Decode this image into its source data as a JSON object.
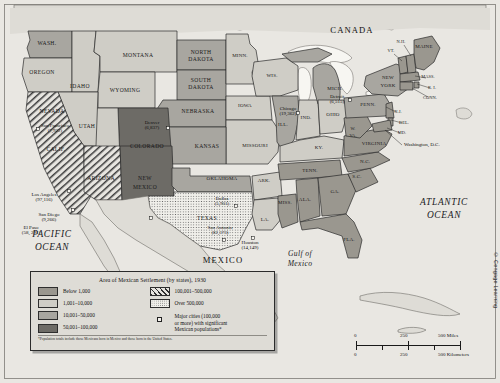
{
  "map": {
    "countries": [
      {
        "name": "CANADA",
        "x": 352,
        "y": 33
      },
      {
        "name": "MEXICO",
        "x": 223,
        "y": 263
      }
    ],
    "oceans": [
      {
        "name": "PACIFIC",
        "x": 52,
        "y": 237
      },
      {
        "name": "OCEAN",
        "x": 52,
        "y": 250
      },
      {
        "name": "ATLANTIC",
        "x": 444,
        "y": 205
      },
      {
        "name": "OCEAN",
        "x": 444,
        "y": 218
      },
      {
        "name": "Gulf of",
        "x": 300,
        "y": 256
      },
      {
        "name": "Mexico",
        "x": 300,
        "y": 266
      }
    ],
    "states": [
      {
        "abbr": "WASH.",
        "x": 47,
        "y": 45,
        "cls": "",
        "category": "10,001-50,000"
      },
      {
        "abbr": "OREGON",
        "x": 42,
        "y": 74,
        "cls": "",
        "category": "1,001-10,000"
      },
      {
        "abbr": "IDAHO",
        "x": 80,
        "y": 88,
        "cls": "",
        "category": "1,001-10,000"
      },
      {
        "abbr": "MONTANA",
        "x": 138,
        "y": 57,
        "cls": "",
        "category": "1,001-10,000"
      },
      {
        "abbr": "NORTH",
        "x": 201,
        "y": 54,
        "cls": "",
        "category": "10,001-50,000"
      },
      {
        "abbr": "DAKOTA",
        "x": 201,
        "y": 61,
        "cls": "",
        "category": "10,001-50,000"
      },
      {
        "abbr": "SOUTH",
        "x": 201,
        "y": 82,
        "cls": "",
        "category": "10,001-50,000"
      },
      {
        "abbr": "DAKOTA",
        "x": 201,
        "y": 89,
        "cls": "",
        "category": "10,001-50,000"
      },
      {
        "abbr": "WYOMING",
        "x": 125,
        "y": 92,
        "cls": "",
        "category": "1,001-10,000"
      },
      {
        "abbr": "NEVADA",
        "x": 52,
        "y": 113,
        "cls": "",
        "category": "1,001-10,000"
      },
      {
        "abbr": "UTAH",
        "x": 87,
        "y": 128,
        "cls": "",
        "category": "1,001-10,000"
      },
      {
        "abbr": "COLORADO",
        "x": 147,
        "y": 148,
        "cls": "",
        "category": "50,001-100,000"
      },
      {
        "abbr": "NEBRASKA",
        "x": 198,
        "y": 113,
        "cls": "",
        "category": "10,001-50,000"
      },
      {
        "abbr": "KANSAS",
        "x": 207,
        "y": 148,
        "cls": "",
        "category": "10,001-50,000"
      },
      {
        "abbr": "MINN.",
        "x": 240,
        "y": 57,
        "cls": "sm",
        "category": "1,001-10,000"
      },
      {
        "abbr": "IOWA",
        "x": 245,
        "y": 107,
        "cls": "sm",
        "category": "1,001-10,000"
      },
      {
        "abbr": "WIS.",
        "x": 272,
        "y": 77,
        "cls": "sm",
        "category": "1,001-10,000"
      },
      {
        "abbr": "MISSOURI",
        "x": 255,
        "y": 147,
        "cls": "sm",
        "category": "1,001-10,000"
      },
      {
        "abbr": "ILL.",
        "x": 283,
        "y": 126,
        "cls": "sm",
        "category": "10,001-50,000"
      },
      {
        "abbr": "IND.",
        "x": 306,
        "y": 119,
        "cls": "sm",
        "category": "1,001-10,000"
      },
      {
        "abbr": "MICH.",
        "x": 335,
        "y": 90,
        "cls": "sm",
        "category": "10,001-50,000"
      },
      {
        "abbr": "OHIO",
        "x": 333,
        "y": 116,
        "cls": "sm",
        "category": "1,001-10,000"
      },
      {
        "abbr": "KY.",
        "x": 319,
        "y": 149,
        "cls": "sm",
        "category": "1,001-10,000"
      },
      {
        "abbr": "CALIF.",
        "x": 56,
        "y": 151,
        "cls": "",
        "category": "100,001-500,000"
      },
      {
        "abbr": "ARIZONA",
        "x": 101,
        "y": 180,
        "cls": "",
        "category": "100,001-500,000"
      },
      {
        "abbr": "NEW",
        "x": 145,
        "y": 180,
        "cls": "",
        "category": "50,001-100,000"
      },
      {
        "abbr": "MEXICO",
        "x": 145,
        "y": 189,
        "cls": "",
        "category": "50,001-100,000"
      },
      {
        "abbr": "OKLAHOMA",
        "x": 222,
        "y": 180,
        "cls": "sm",
        "category": "10,001-50,000"
      },
      {
        "abbr": "TEXAS",
        "x": 207,
        "y": 220,
        "cls": "",
        "category": "Over 500,000"
      },
      {
        "abbr": "ARK.",
        "x": 264,
        "y": 182,
        "cls": "sm",
        "category": "1,001-10,000"
      },
      {
        "abbr": "LA.",
        "x": 265,
        "y": 221,
        "cls": "sm",
        "category": "1,001-10,000"
      },
      {
        "abbr": "MISS.",
        "x": 285,
        "y": 204,
        "cls": "sm",
        "category": "Below 1,000"
      },
      {
        "abbr": "TENN.",
        "x": 310,
        "y": 172,
        "cls": "sm",
        "category": "Below 1,000"
      },
      {
        "abbr": "ALA.",
        "x": 305,
        "y": 201,
        "cls": "sm",
        "category": "Below 1,000"
      },
      {
        "abbr": "GA.",
        "x": 335,
        "y": 193,
        "cls": "sm",
        "category": "Below 1,000"
      },
      {
        "abbr": "FLA.",
        "x": 349,
        "y": 241,
        "cls": "sm",
        "category": "Below 1,000"
      },
      {
        "abbr": "S.C.",
        "x": 357,
        "y": 178,
        "cls": "sm",
        "category": "Below 1,000"
      },
      {
        "abbr": "N.C.",
        "x": 365,
        "y": 163,
        "cls": "sm",
        "category": "Below 1,000"
      },
      {
        "abbr": "VIRGINIA",
        "x": 374,
        "y": 145,
        "cls": "sm",
        "category": "Below 1,000"
      },
      {
        "abbr": "W.",
        "x": 353,
        "y": 130,
        "cls": "xs",
        "category": "Below 1,000"
      },
      {
        "abbr": "VA.",
        "x": 353,
        "y": 137,
        "cls": "xs",
        "category": "Below 1,000"
      },
      {
        "abbr": "PENN.",
        "x": 368,
        "y": 106,
        "cls": "sm",
        "category": "10,001-50,000"
      },
      {
        "abbr": "NEW",
        "x": 388,
        "y": 79,
        "cls": "sm",
        "category": "10,001-50,000"
      },
      {
        "abbr": "YORK",
        "x": 388,
        "y": 87,
        "cls": "sm",
        "category": "10,001-50,000"
      },
      {
        "abbr": "MAINE",
        "x": 424,
        "y": 48,
        "cls": "sm",
        "category": "Below 1,000"
      }
    ],
    "callout_states": [
      {
        "abbr": "N.H.",
        "x": 401,
        "y": 43,
        "lx1": 404,
        "ly1": 45,
        "lx2": 411,
        "ly2": 56,
        "category": "Below 1,000"
      },
      {
        "abbr": "VT.",
        "x": 391,
        "y": 52,
        "lx1": 394,
        "ly1": 54,
        "lx2": 402,
        "ly2": 61,
        "category": "Below 1,000"
      },
      {
        "abbr": "MASS.",
        "x": 428,
        "y": 78,
        "lx1": 426,
        "ly1": 78,
        "lx2": 415,
        "ly2": 76,
        "category": "Below 1,000"
      },
      {
        "abbr": "R. I.",
        "x": 432,
        "y": 89,
        "lx1": 430,
        "ly1": 88,
        "lx2": 417,
        "ly2": 84,
        "category": "Below 1,000"
      },
      {
        "abbr": "CONN.",
        "x": 430,
        "y": 99,
        "lx1": 428,
        "ly1": 97,
        "lx2": 412,
        "ly2": 88,
        "category": "Below 1,000"
      },
      {
        "abbr": "N.J.",
        "x": 398,
        "y": 113,
        "lx1": 396,
        "ly1": 112,
        "lx2": 386,
        "ly2": 107,
        "category": "Below 1,000"
      },
      {
        "abbr": "DEL.",
        "x": 404,
        "y": 124,
        "lx1": 402,
        "ly1": 123,
        "lx2": 391,
        "ly2": 120,
        "category": "Below 1,000"
      },
      {
        "abbr": "MD.",
        "x": 402,
        "y": 134,
        "lx1": 400,
        "ly1": 133,
        "lx2": 387,
        "ly2": 128,
        "category": "Below 1,000"
      },
      {
        "abbr": "Washington, D.C.",
        "x": 404,
        "y": 146,
        "lx1": 402,
        "ly1": 145,
        "lx2": 385,
        "ly2": 130,
        "category": ""
      }
    ],
    "cities": [
      {
        "name": "San Francisco",
        "pop": "(7,922)",
        "lx": 55,
        "ly": 127,
        "dx": 38,
        "dy": 129
      },
      {
        "name": "Los Angeles",
        "pop": "(97,116)",
        "lx": 44,
        "ly": 196,
        "dx": 69,
        "dy": 191
      },
      {
        "name": "San Diego",
        "pop": "(9,266)",
        "lx": 49,
        "ly": 216,
        "dx": 73,
        "dy": 210
      },
      {
        "name": "Denver",
        "pop": "(6,837)",
        "lx": 152,
        "ly": 124,
        "dx": 168,
        "dy": 128
      },
      {
        "name": "El Paso",
        "pop": "(58, 291)",
        "lx": 31,
        "ly": 229,
        "dx": 151,
        "dy": 218
      },
      {
        "name": "Dallas",
        "pop": "(5,901)",
        "lx": 222,
        "ly": 200,
        "dx": 236,
        "dy": 206
      },
      {
        "name": "San Antonio",
        "pop": "(82,373)",
        "lx": 220,
        "ly": 229,
        "dx": 224,
        "dy": 240
      },
      {
        "name": "Houston",
        "pop": "(14,149)",
        "lx": 250,
        "ly": 244,
        "dx": 253,
        "dy": 238
      },
      {
        "name": "Chicago",
        "pop": "(19,362)",
        "lx": 288,
        "ly": 110,
        "dx": 298,
        "dy": 113
      },
      {
        "name": "Detroit",
        "pop": "(6,515)",
        "lx": 337,
        "ly": 98,
        "dx": 350,
        "dy": 100
      }
    ]
  },
  "legend": {
    "title": "Area of Mexican Settlement (by states), 1930",
    "left_items": [
      {
        "label": "Below 1,000",
        "swatch": "sw-b1000"
      },
      {
        "label": "1,001–10,000",
        "swatch": "sw-b10k"
      },
      {
        "label": "10,001–50,000",
        "swatch": "sw-b50k"
      },
      {
        "label": "50,001–100,000",
        "swatch": "sw-b100k"
      }
    ],
    "right_items": [
      {
        "label": "100,001–500,000",
        "swatch": "sw-hatch"
      },
      {
        "label": "Over 500,000",
        "swatch": "sw-dot"
      }
    ],
    "city_note_line1": "Major cities (100,000",
    "city_note_line2": "or more) with significant",
    "city_note_line3": "Mexican populations*",
    "footnote": "*Population totals include those Mexicans born in Mexico and those born in the United States."
  },
  "scale": {
    "miles": [
      "0",
      "250",
      "500 Miles"
    ],
    "kilometers": [
      "0",
      "250",
      "500 Kilometers"
    ]
  },
  "copyright": "© Cengage Learning"
}
